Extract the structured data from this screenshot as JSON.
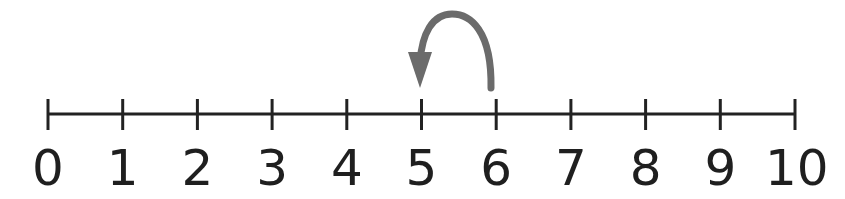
{
  "number_line": {
    "min": 0,
    "max": 10,
    "labels": [
      "0",
      "1",
      "2",
      "3",
      "4",
      "5",
      "6",
      "7",
      "8",
      "9",
      "10"
    ],
    "line_color": "#222222"
  },
  "jump_arrow": {
    "from": 6,
    "to": 5,
    "direction": "backward",
    "color": "#6b6b6b"
  }
}
